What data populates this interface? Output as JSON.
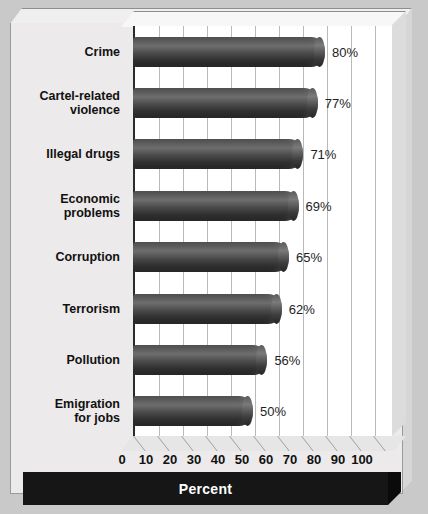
{
  "chart_data": {
    "type": "bar",
    "orientation": "horizontal",
    "title": "",
    "xlabel": "Percent",
    "ylabel": "",
    "xlim": [
      0,
      100
    ],
    "xticks": [
      0,
      10,
      20,
      30,
      40,
      50,
      60,
      70,
      80,
      90,
      100
    ],
    "tick_labels": [
      "0",
      "10",
      "20",
      "30",
      "40",
      "50",
      "60",
      "70",
      "80",
      "90",
      "100"
    ],
    "grid": true,
    "legend": false,
    "categories": [
      "Crime",
      "Cartel-related violence",
      "Illegal drugs",
      "Economic problems",
      "Corruption",
      "Terrorism",
      "Pollution",
      "Emigration for jobs"
    ],
    "category_lines": [
      [
        "Crime"
      ],
      [
        "Cartel-related",
        "violence"
      ],
      [
        "Illegal drugs"
      ],
      [
        "Economic",
        "problems"
      ],
      [
        "Corruption"
      ],
      [
        "Terrorism"
      ],
      [
        "Pollution"
      ],
      [
        "Emigration",
        "for jobs"
      ]
    ],
    "values": [
      80,
      77,
      71,
      69,
      65,
      62,
      56,
      50
    ],
    "value_labels": [
      "80%",
      "77%",
      "71%",
      "69%",
      "65%",
      "62%",
      "56%",
      "50%"
    ]
  },
  "style": {
    "background": "#c9c9c9",
    "panel": "#eceaea",
    "plot_background": "#ffffff",
    "bar_color": "#3a3a3a",
    "gridline_color": "#b9b9b9",
    "axis_color": "#2b2b2b",
    "footer_background": "#161616",
    "footer_text": "#ffffff"
  }
}
